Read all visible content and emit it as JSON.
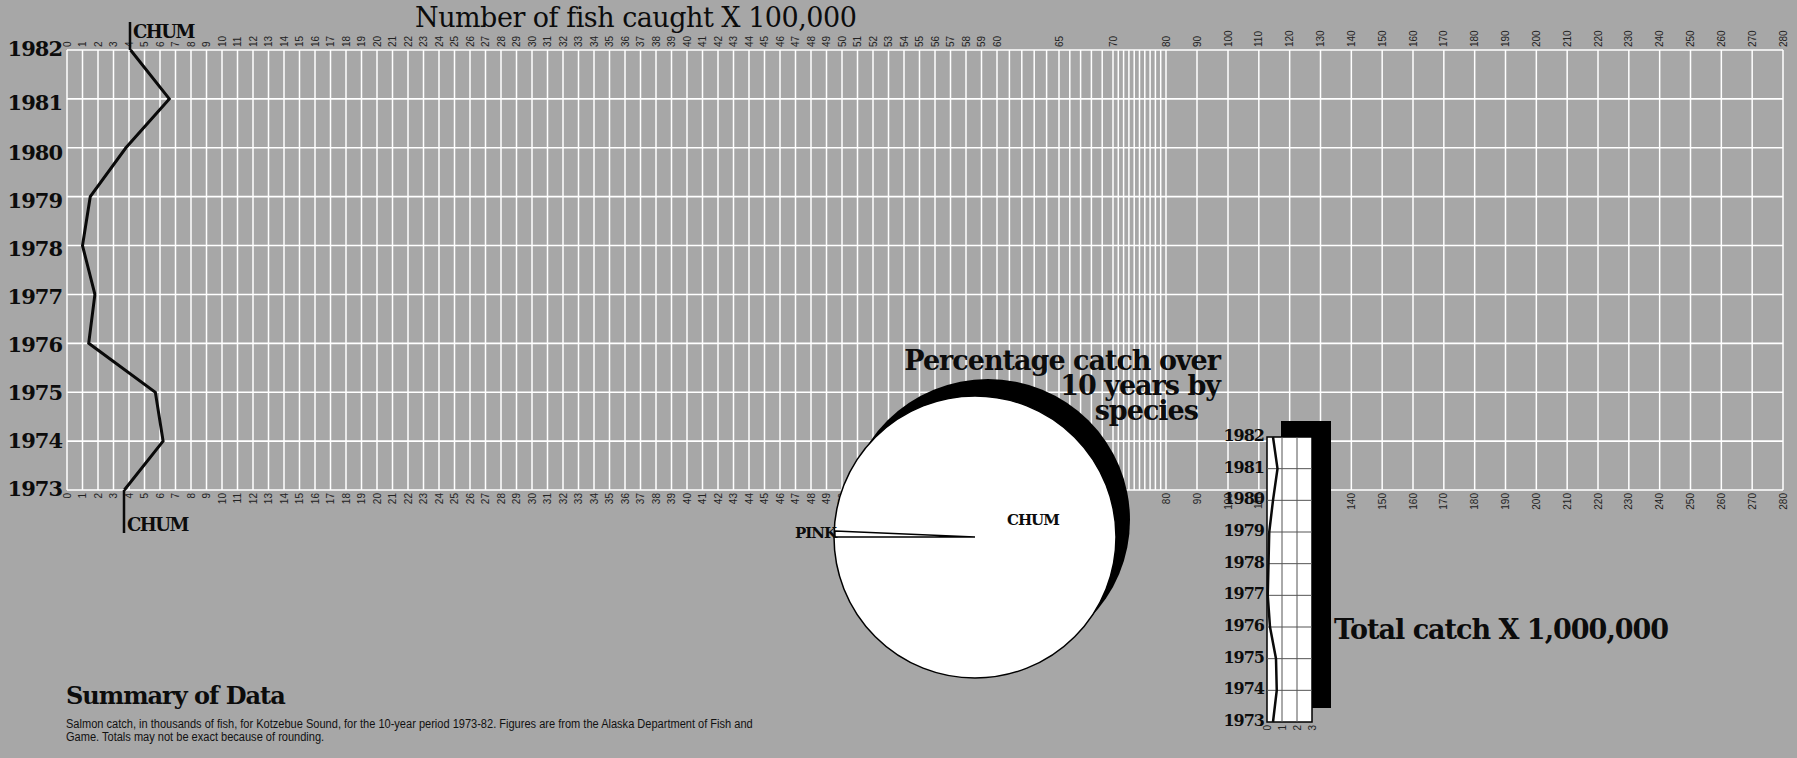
{
  "main_title": "Number of fish caught X 100,000",
  "series_label_top": "CHUM",
  "series_label_bottom": "CHUM",
  "years": [
    "1982",
    "1981",
    "1980",
    "1979",
    "1978",
    "1977",
    "1976",
    "1975",
    "1974",
    "1973"
  ],
  "pie": {
    "title_line1": "Percentage catch over",
    "title_line2": "10 years by",
    "title_line3": "species",
    "label_chum": "CHUM",
    "label_pink": "PINK"
  },
  "total": {
    "title": "Total catch X 1,000,000",
    "years": [
      "1982",
      "1981",
      "1980",
      "1979",
      "1978",
      "1977",
      "1976",
      "1975",
      "1974",
      "1973"
    ],
    "ticks": [
      "0",
      "1",
      "2",
      "3"
    ]
  },
  "summary": {
    "title": "Summary of Data",
    "text": "Salmon catch, in thousands of fish, for Kotzebue Sound, for the 10-year period 1973-82. Figures are from the Alaska Department of Fish and Game. Totals may not be exact because of rounding."
  },
  "colors": {
    "background": "#a7a7a7",
    "grid": "#ffffff",
    "line": "#0a0a0a",
    "pie_fill": "#ffffff",
    "shadow": "#000000"
  },
  "chart_data": [
    {
      "type": "line",
      "title": "Number of fish caught X 100,000",
      "orientation": "horizontal-values, vertical-years",
      "x_ticks": [
        "0",
        "1",
        "2",
        "3",
        "4",
        "5",
        "6",
        "7",
        "8",
        "9",
        "10",
        "11",
        "12",
        "13",
        "14",
        "15",
        "16",
        "17",
        "18",
        "19",
        "20",
        "21",
        "22",
        "23",
        "24",
        "25",
        "26",
        "27",
        "28",
        "29",
        "30",
        "31",
        "32",
        "33",
        "34",
        "35",
        "36",
        "37",
        "38",
        "39",
        "40",
        "41",
        "42",
        "43",
        "44",
        "45",
        "46",
        "47",
        "48",
        "49",
        "50",
        "51",
        "52",
        "53",
        "54",
        "55",
        "56",
        "57",
        "58",
        "59",
        "60",
        "65",
        "70",
        "80",
        "90",
        "100",
        "110",
        "120",
        "130",
        "140",
        "150",
        "160",
        "170",
        "180",
        "190",
        "200",
        "210",
        "220",
        "230",
        "240",
        "250",
        "260",
        "270",
        "280"
      ],
      "xlim": [
        0,
        280
      ],
      "xlabel": "Number of fish caught X 100,000",
      "ylabel": "",
      "categories": [
        "1982",
        "1981",
        "1980",
        "1979",
        "1978",
        "1977",
        "1976",
        "1975",
        "1974",
        "1973"
      ],
      "series": [
        {
          "name": "CHUM",
          "values": [
            4.1,
            6.6,
            3.8,
            1.5,
            1.0,
            1.8,
            1.4,
            5.7,
            6.2,
            3.7
          ]
        }
      ],
      "grid": true
    },
    {
      "type": "pie",
      "title": "Percentage catch over 10 years by species",
      "categories": [
        "CHUM",
        "PINK"
      ],
      "values": [
        99.5,
        0.5
      ]
    },
    {
      "type": "line",
      "title": "Total catch X 1,000,000",
      "categories": [
        "1982",
        "1981",
        "1980",
        "1979",
        "1978",
        "1977",
        "1976",
        "1975",
        "1974",
        "1973"
      ],
      "x_ticks": [
        "0",
        "1",
        "2",
        "3"
      ],
      "xlim": [
        0,
        3
      ],
      "series": [
        {
          "name": "Total",
          "values": [
            0.4,
            0.7,
            0.4,
            0.15,
            0.1,
            0.05,
            0.2,
            0.6,
            0.65,
            0.4
          ]
        }
      ],
      "grid": true
    }
  ]
}
